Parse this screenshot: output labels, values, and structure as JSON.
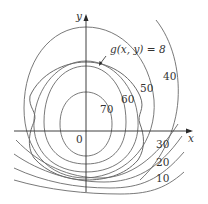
{
  "diagram": {
    "type": "contour-map",
    "axes": {
      "x_label": "x",
      "y_label": "y",
      "origin_label": "0"
    },
    "constraint": {
      "label": "g(x, y) = 8"
    },
    "level_curves": [
      {
        "label": "70"
      },
      {
        "label": "60"
      },
      {
        "label": "50"
      },
      {
        "label": "40"
      },
      {
        "label": "30"
      },
      {
        "label": "20"
      },
      {
        "label": "10"
      }
    ],
    "colors": {
      "curve": "#6a6a6a",
      "axis": "#2a2a2a",
      "text": "#333333",
      "background": "#ffffff"
    }
  }
}
